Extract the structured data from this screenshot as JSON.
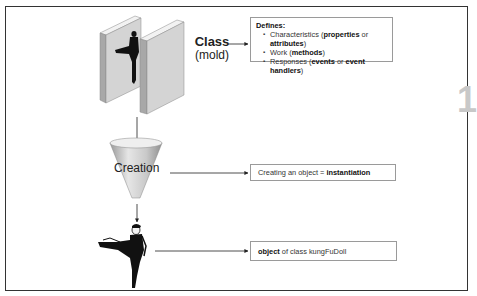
{
  "figure": {
    "chapter_marker": "1",
    "class_label": {
      "title": "Class",
      "subtitle": "(mold)"
    },
    "defines_box": {
      "heading": "Defines:",
      "items": [
        {
          "prefix": "Characteristics (",
          "bold": "properties",
          "middle": " or ",
          "bold2": "attributes",
          "suffix": ")"
        },
        {
          "prefix": "Work (",
          "bold": "methods",
          "middle": "",
          "bold2": "",
          "suffix": ")"
        },
        {
          "prefix": "Responses (",
          "bold": "events",
          "middle": " or ",
          "bold2": "event handlers",
          "suffix": ")"
        }
      ]
    },
    "creation_label": "Creation",
    "creation_box": {
      "prefix": "Creating an object = ",
      "bold": "instantiation"
    },
    "object_box": {
      "bold": "object",
      "suffix": " of class kungFuDoll"
    },
    "colors": {
      "frame": "#333333",
      "box_border": "#9a9a9a",
      "mold_face": "#d4d4d4",
      "mold_side": "#a8a8a8",
      "mold_top": "#f2f2f2",
      "silhouette": "#111111",
      "chapter_marker": "#c8c8c8"
    }
  }
}
